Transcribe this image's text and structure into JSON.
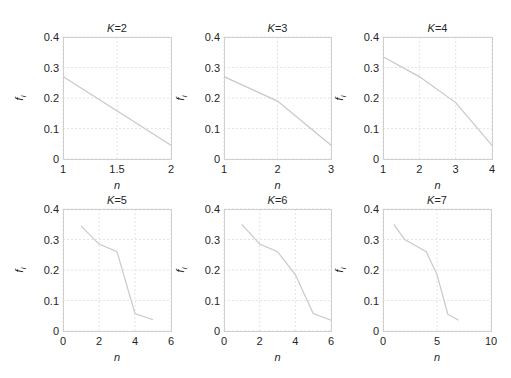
{
  "chart_data": [
    {
      "type": "line",
      "title": "K=2",
      "xlabel": "n",
      "ylabel": "f_i",
      "xlim": [
        1,
        2
      ],
      "ylim": [
        0,
        0.4
      ],
      "xticks": [
        1,
        1.5,
        2
      ],
      "xtick_labels": [
        "1",
        "1.5",
        "2"
      ],
      "yticks": [
        0,
        0.1,
        0.2,
        0.3,
        0.4
      ],
      "ytick_labels": [
        "0",
        "0.1",
        "0.2",
        "0.3",
        "0.4"
      ],
      "grid": true,
      "x": [
        1,
        2
      ],
      "values": [
        0.27,
        0.045
      ]
    },
    {
      "type": "line",
      "title": "K=3",
      "xlabel": "n",
      "ylabel": "f_i",
      "xlim": [
        1,
        3
      ],
      "ylim": [
        0,
        0.4
      ],
      "xticks": [
        1,
        2,
        3
      ],
      "xtick_labels": [
        "1",
        "2",
        "3"
      ],
      "yticks": [
        0,
        0.1,
        0.2,
        0.3,
        0.4
      ],
      "ytick_labels": [
        "0",
        "0.1",
        "0.2",
        "0.3",
        "0.4"
      ],
      "grid": true,
      "x": [
        1,
        2,
        3
      ],
      "values": [
        0.27,
        0.19,
        0.045
      ]
    },
    {
      "type": "line",
      "title": "K=4",
      "xlabel": "n",
      "ylabel": "f_i",
      "xlim": [
        1,
        4
      ],
      "ylim": [
        0,
        0.4
      ],
      "xticks": [
        1,
        2,
        3,
        4
      ],
      "xtick_labels": [
        "1",
        "2",
        "3",
        "4"
      ],
      "yticks": [
        0,
        0.1,
        0.2,
        0.3,
        0.4
      ],
      "ytick_labels": [
        "0",
        "0.1",
        "0.2",
        "0.3",
        "0.4"
      ],
      "grid": true,
      "x": [
        1,
        2,
        3,
        4
      ],
      "values": [
        0.335,
        0.27,
        0.185,
        0.045
      ]
    },
    {
      "type": "line",
      "title": "K=5",
      "xlabel": "n",
      "ylabel": "f_i",
      "xlim": [
        0,
        6
      ],
      "ylim": [
        0,
        0.4
      ],
      "xticks": [
        0,
        2,
        4,
        6
      ],
      "xtick_labels": [
        "0",
        "2",
        "4",
        "6"
      ],
      "yticks": [
        0,
        0.1,
        0.2,
        0.3,
        0.4
      ],
      "ytick_labels": [
        "0",
        "0.1",
        "0.2",
        "0.3",
        "0.4"
      ],
      "grid": true,
      "x": [
        1,
        2,
        3,
        4,
        5
      ],
      "values": [
        0.345,
        0.285,
        0.26,
        0.057,
        0.037
      ]
    },
    {
      "type": "line",
      "title": "K=6",
      "xlabel": "n",
      "ylabel": "f_i",
      "xlim": [
        0,
        6
      ],
      "ylim": [
        0,
        0.4
      ],
      "xticks": [
        0,
        2,
        4,
        6
      ],
      "xtick_labels": [
        "0",
        "2",
        "4",
        "6"
      ],
      "yticks": [
        0,
        0.1,
        0.2,
        0.3,
        0.4
      ],
      "ytick_labels": [
        "0",
        "0.1",
        "0.2",
        "0.3",
        "0.4"
      ],
      "grid": true,
      "x": [
        1,
        2,
        3,
        4,
        5,
        6
      ],
      "values": [
        0.35,
        0.285,
        0.26,
        0.185,
        0.057,
        0.035
      ]
    },
    {
      "type": "line",
      "title": "K=7",
      "xlabel": "n",
      "ylabel": "f_i",
      "xlim": [
        0,
        10
      ],
      "ylim": [
        0,
        0.4
      ],
      "xticks": [
        0,
        5,
        10
      ],
      "xtick_labels": [
        "0",
        "5",
        "10"
      ],
      "yticks": [
        0,
        0.1,
        0.2,
        0.3,
        0.4
      ],
      "ytick_labels": [
        "0",
        "0.1",
        "0.2",
        "0.3",
        "0.4"
      ],
      "grid": true,
      "x": [
        1,
        2,
        3,
        4,
        5,
        6,
        7
      ],
      "values": [
        0.35,
        0.3,
        0.28,
        0.26,
        0.185,
        0.055,
        0.035
      ]
    }
  ],
  "style": {
    "line_color": "#c8c8c8",
    "grid_color": "#e4e4e4",
    "axes_color": "#d0d0d0",
    "text_color": "#262626"
  }
}
